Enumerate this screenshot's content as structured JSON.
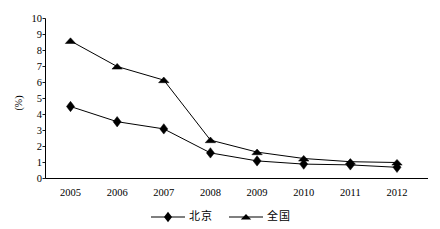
{
  "chart_data": {
    "type": "line",
    "title": "",
    "subtitle": "",
    "xlabel": "",
    "ylabel": "(%)",
    "categories": [
      "2005",
      "2006",
      "2007",
      "2008",
      "2009",
      "2010",
      "2011",
      "2012"
    ],
    "x": [
      2005,
      2006,
      2007,
      2008,
      2009,
      2010,
      2011,
      2012
    ],
    "series": [
      {
        "name": "北京",
        "marker": "diamond",
        "color": "#000000",
        "values": [
          4.5,
          3.55,
          3.1,
          1.6,
          1.1,
          0.9,
          0.85,
          0.7
        ]
      },
      {
        "name": "全国",
        "marker": "triangle",
        "color": "#000000",
        "values": [
          8.6,
          7.0,
          6.15,
          2.4,
          1.65,
          1.25,
          1.05,
          1.0
        ]
      }
    ],
    "ylim": [
      0,
      10
    ],
    "y_ticks": [
      "0",
      "1",
      "2",
      "3",
      "4",
      "5",
      "6",
      "7",
      "8",
      "9",
      "10"
    ],
    "y_tick_values": [
      0,
      1,
      2,
      3,
      4,
      5,
      6,
      7,
      8,
      9,
      10
    ],
    "grid": false,
    "legend_position": "bottom-center",
    "legend": [
      "北京",
      "全国"
    ],
    "axis_color": "#000000",
    "background_color": "#ffffff"
  },
  "legend": {
    "entries": [
      {
        "label": "北京",
        "marker": "diamond-marker-icon"
      },
      {
        "label": "全国",
        "marker": "triangle-marker-icon"
      }
    ]
  },
  "axes": {
    "y_title": "(%)"
  }
}
